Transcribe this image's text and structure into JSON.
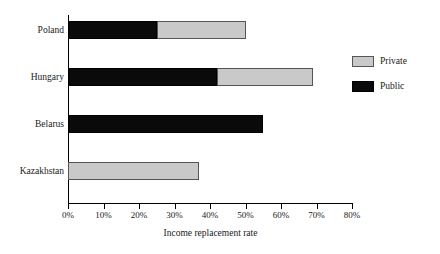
{
  "chart_data": {
    "type": "bar",
    "orientation": "horizontal",
    "stacked": true,
    "title": "",
    "xlabel": "Income replacement rate",
    "ylabel": "",
    "xlim": [
      0,
      80
    ],
    "grid": false,
    "legend_position": "right",
    "categories": [
      "Poland",
      "Hungary",
      "Belarus",
      "Kazakhstan"
    ],
    "series": [
      {
        "name": "Public",
        "color": "#0a0a0a",
        "values": [
          25,
          42,
          55,
          0
        ]
      },
      {
        "name": "Private",
        "color": "#c9c9c9",
        "values": [
          25,
          27,
          0,
          37
        ]
      }
    ],
    "totals": [
      50,
      69,
      55,
      37
    ],
    "tick_labels": [
      "0%",
      "10%",
      "20%",
      "30%",
      "40%",
      "50%",
      "60%",
      "70%",
      "80%"
    ],
    "tick_values": [
      0,
      10,
      20,
      30,
      40,
      50,
      60,
      70,
      80
    ]
  },
  "legend": {
    "items": [
      {
        "label": "Private",
        "swatch": "private-swatch"
      },
      {
        "label": "Public",
        "swatch": "public-swatch"
      }
    ]
  },
  "axis": {
    "title": "Income replacement rate"
  }
}
